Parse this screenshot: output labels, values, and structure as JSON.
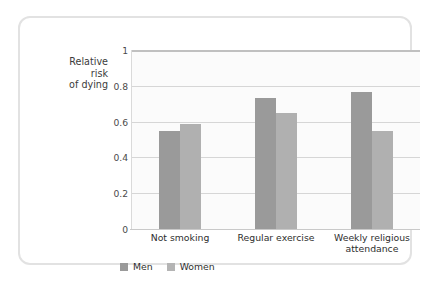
{
  "chart_data": {
    "type": "bar",
    "title": "",
    "subtitle": "",
    "xlabel": "",
    "ylabel": "Relative\nrisk\nof dying",
    "ylim": [
      0,
      1
    ],
    "yticks": [
      "1",
      "0.8",
      "0.6",
      "0.4",
      "0.2",
      "0"
    ],
    "ytick_values": [
      1,
      0.8,
      0.6,
      0.4,
      0.2,
      0
    ],
    "grid": true,
    "legend_position": "bottom-left",
    "categories": [
      "Not smoking",
      "Regular exercise",
      "Weekly religious\nattendance"
    ],
    "series": [
      {
        "name": "Men",
        "color": "#9a9a9a",
        "values": [
          0.545,
          0.73,
          0.765
        ]
      },
      {
        "name": "Women",
        "color": "#b0b0b0",
        "values": [
          0.585,
          0.648,
          0.545
        ]
      }
    ]
  },
  "legend": {
    "items": [
      {
        "label": "Men",
        "color": "#9a9a9a"
      },
      {
        "label": "Women",
        "color": "#b4b4b4"
      }
    ]
  },
  "colors": {
    "frame_border": "#e2e2e2",
    "plot_background": "#fbfbfb",
    "gridline": "#d6d6d6",
    "axis": "#c9c9c9",
    "text": "#2e2e2e"
  }
}
